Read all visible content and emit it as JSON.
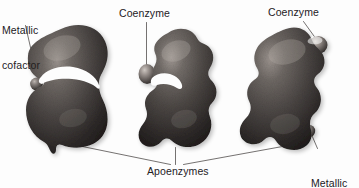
{
  "figure": {
    "background_color": "#fdfdfd",
    "ink_color": "#23201e",
    "blob_color": "#4a4542",
    "blob_highlight": "#b9b2ad",
    "blob_shadow": "#1c1917",
    "sphere_color": "#6b6460",
    "type": "biology-illustration"
  },
  "labels": {
    "metallic_cofactor_left": {
      "line1": "Metallic",
      "line2": "cofactor"
    },
    "coenzyme_middle": {
      "text": "Coenzyme"
    },
    "coenzyme_right": {
      "text": "Coenzyme"
    },
    "apoenzymes": {
      "text": "Apoenzymes"
    },
    "metallic_cofactor_right": {
      "line1": "Metallic",
      "line2": "cofactor"
    }
  },
  "shapes": [
    {
      "name": "apoenzyme-left",
      "description": "kidney-bean shaped apoenzyme with deep left notch",
      "attachments": [
        "metallic-cofactor-sphere-left"
      ]
    },
    {
      "name": "apoenzyme-middle",
      "description": "upright lobed apoenzyme with left-side notch",
      "attachments": [
        "coenzyme-sphere-middle"
      ]
    },
    {
      "name": "apoenzyme-right",
      "description": "peanut/hourglass shaped apoenzyme",
      "attachments": [
        "coenzyme-sphere-right",
        "metallic-cofactor-sphere-right"
      ]
    }
  ]
}
